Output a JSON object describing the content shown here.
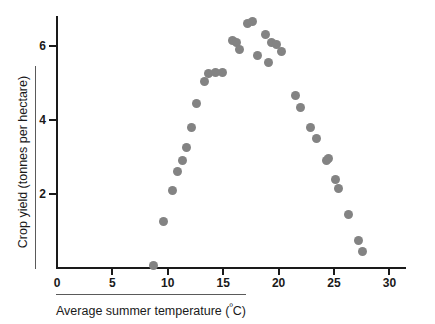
{
  "chart_data": {
    "type": "scatter",
    "title": "",
    "xlabel": "Average summer temperature (ºC)",
    "ylabel": "Crop yield (tonnes per hectare)",
    "xlim": [
      0,
      31.5
    ],
    "ylim": [
      0,
      6.8
    ],
    "grid": false,
    "legend": "none",
    "marker_color": "#838383",
    "axis_color": "#1a1a1a",
    "xticks": [
      0,
      5,
      10,
      15,
      20,
      25,
      30
    ],
    "xtick_labels": [
      "0",
      "5",
      "10",
      "15",
      "20",
      "25",
      "30"
    ],
    "yticks": [
      2,
      4,
      6
    ],
    "ytick_labels": [
      "2",
      "4",
      "6"
    ],
    "series": [
      {
        "name": "Crop yield vs temperature",
        "points": [
          {
            "x": 8.7,
            "y": 0.08
          },
          {
            "x": 9.6,
            "y": 1.25
          },
          {
            "x": 10.4,
            "y": 2.1
          },
          {
            "x": 10.9,
            "y": 2.6
          },
          {
            "x": 11.3,
            "y": 2.9
          },
          {
            "x": 11.7,
            "y": 3.25
          },
          {
            "x": 12.1,
            "y": 3.8
          },
          {
            "x": 12.6,
            "y": 4.45
          },
          {
            "x": 13.3,
            "y": 5.05
          },
          {
            "x": 13.7,
            "y": 5.25
          },
          {
            "x": 14.3,
            "y": 5.28
          },
          {
            "x": 14.9,
            "y": 5.28
          },
          {
            "x": 15.8,
            "y": 6.15
          },
          {
            "x": 16.2,
            "y": 6.1
          },
          {
            "x": 16.5,
            "y": 5.9
          },
          {
            "x": 17.2,
            "y": 6.62
          },
          {
            "x": 17.6,
            "y": 6.65
          },
          {
            "x": 18.1,
            "y": 5.75
          },
          {
            "x": 18.8,
            "y": 6.3
          },
          {
            "x": 19.1,
            "y": 5.55
          },
          {
            "x": 19.4,
            "y": 6.1
          },
          {
            "x": 19.8,
            "y": 6.05
          },
          {
            "x": 20.3,
            "y": 5.85
          },
          {
            "x": 21.5,
            "y": 4.65
          },
          {
            "x": 22.0,
            "y": 4.35
          },
          {
            "x": 22.9,
            "y": 3.8
          },
          {
            "x": 23.4,
            "y": 3.5
          },
          {
            "x": 24.3,
            "y": 2.9
          },
          {
            "x": 24.5,
            "y": 2.95
          },
          {
            "x": 25.1,
            "y": 2.4
          },
          {
            "x": 25.4,
            "y": 2.15
          },
          {
            "x": 26.3,
            "y": 1.45
          },
          {
            "x": 27.2,
            "y": 0.75
          },
          {
            "x": 27.6,
            "y": 0.45
          }
        ]
      }
    ]
  }
}
